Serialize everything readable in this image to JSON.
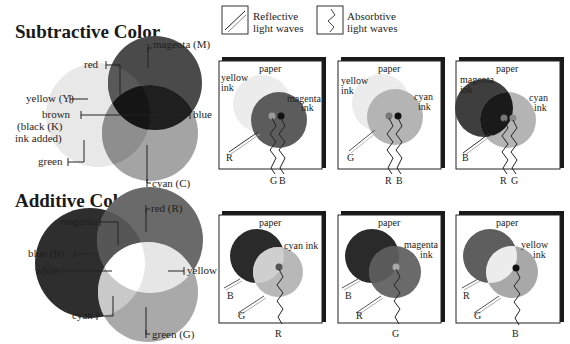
{
  "legend": {
    "reflective": {
      "label_line1": "Reflective",
      "label_line2": "light waves",
      "icon": "diagonal-lines-icon"
    },
    "absorptive": {
      "label_line1": "Absorbtive",
      "label_line2": "light waves",
      "icon": "zigzag-line-icon"
    }
  },
  "subtractive": {
    "title": "Subtractive Color",
    "labels": {
      "magenta": "magenta (M)",
      "red": "red",
      "yellow": "yellow (Y)",
      "brown_1": "brown",
      "brown_2": "(black (K)",
      "brown_3": "ink added)",
      "blue": "blue",
      "green": "green",
      "cyan": "cyan (C)"
    },
    "panels": [
      {
        "paper": "paper",
        "ink_a": [
          "yellow",
          "ink"
        ],
        "ink_b": [
          "magenta",
          "ink"
        ],
        "reflected": "R",
        "absorbed": [
          "G",
          "B"
        ]
      },
      {
        "paper": "paper",
        "ink_a": [
          "yellow",
          "ink"
        ],
        "ink_b": [
          "cyan",
          "ink"
        ],
        "reflected": "G",
        "absorbed": [
          "R",
          "B"
        ]
      },
      {
        "paper": "paper",
        "ink_a": [
          "magenta",
          "ink"
        ],
        "ink_b": [
          "cyan",
          "ink"
        ],
        "reflected": "B",
        "absorbed": [
          "R",
          "G"
        ]
      }
    ]
  },
  "additive": {
    "title": "Additive Color",
    "labels": {
      "red": "red (R)",
      "magenta": "magenta",
      "blue": "blue (B)",
      "white": "white",
      "yellow": "yellow",
      "cyan": "cyan",
      "green": "green (G)"
    },
    "panels": [
      {
        "paper": "paper",
        "ink_b": [
          "cyan ink",
          ""
        ],
        "reflected": [
          "B",
          "G"
        ],
        "absorbed": "R"
      },
      {
        "paper": "paper",
        "ink_b": [
          "magenta",
          "ink"
        ],
        "reflected": [
          "B",
          "R"
        ],
        "absorbed": "G"
      },
      {
        "paper": "paper",
        "ink_b": [
          "yellow",
          "ink"
        ],
        "reflected": [
          "R",
          "G"
        ],
        "absorbed": "B"
      }
    ]
  }
}
